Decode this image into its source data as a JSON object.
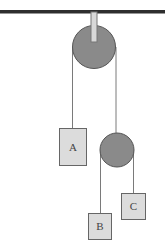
{
  "diagram": {
    "type": "pulley-system",
    "colors": {
      "ceiling": "#2e2e2e",
      "rod_fill": "#d8d8d8",
      "rod_stroke": "#777777",
      "pulley_fill": "#8a8a8a",
      "pulley_stroke": "#555555",
      "rope": "#7a7a7a",
      "block_fill": "#dcdcdc",
      "block_stroke": "#666666"
    },
    "blocks": [
      {
        "id": "A",
        "label": "A"
      },
      {
        "id": "B",
        "label": "B"
      },
      {
        "id": "C",
        "label": "C"
      }
    ],
    "pulleys": [
      {
        "id": "top",
        "type": "fixed"
      },
      {
        "id": "lower",
        "type": "movable"
      }
    ]
  }
}
